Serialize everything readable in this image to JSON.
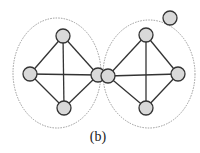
{
  "caption": "(b)",
  "colors": {
    "node_fill": "#d9d9d9",
    "node_stroke": "#333333",
    "edge": "#333333",
    "ellipse": "#9a9a9a"
  },
  "clusters": [
    {
      "id": "left",
      "cx": 57,
      "cy": 73,
      "rx": 44,
      "ry": 55
    },
    {
      "id": "right",
      "cx": 149,
      "cy": 74,
      "rx": 46,
      "ry": 54
    }
  ],
  "nodes": [
    {
      "id": "L-top",
      "x": 63,
      "y": 36
    },
    {
      "id": "L-left",
      "x": 30,
      "y": 74
    },
    {
      "id": "L-bottom",
      "x": 64,
      "y": 108
    },
    {
      "id": "L-right",
      "x": 98,
      "y": 75
    },
    {
      "id": "R-left",
      "x": 108,
      "y": 76
    },
    {
      "id": "R-top",
      "x": 146,
      "y": 35
    },
    {
      "id": "R-right",
      "x": 178,
      "y": 74
    },
    {
      "id": "R-bottom",
      "x": 146,
      "y": 108
    },
    {
      "id": "isolated",
      "x": 170,
      "y": 18
    }
  ],
  "edges": [
    [
      "L-left",
      "L-top"
    ],
    [
      "L-top",
      "L-right"
    ],
    [
      "L-right",
      "L-bottom"
    ],
    [
      "L-bottom",
      "L-left"
    ],
    [
      "L-left",
      "L-right"
    ],
    [
      "L-top",
      "L-bottom"
    ],
    [
      "R-left",
      "R-top"
    ],
    [
      "R-top",
      "R-right"
    ],
    [
      "R-right",
      "R-bottom"
    ],
    [
      "R-bottom",
      "R-left"
    ],
    [
      "R-left",
      "R-right"
    ],
    [
      "R-top",
      "R-bottom"
    ]
  ],
  "node_radius": 7
}
